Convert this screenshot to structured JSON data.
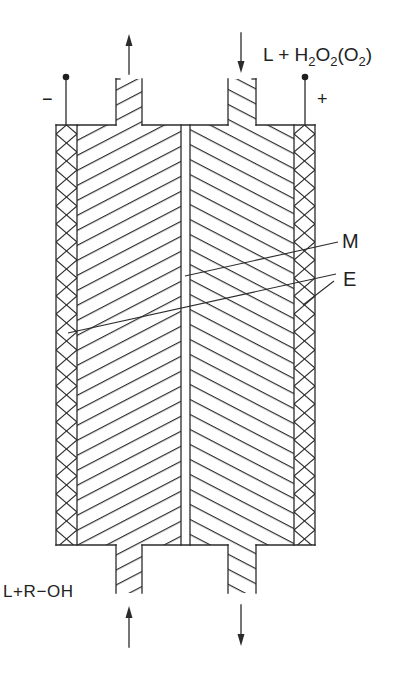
{
  "diagram": {
    "labels": {
      "top_right": {
        "parts": [
          "L + H",
          "2",
          "O",
          "2",
          "(O",
          "2",
          ")"
        ]
      },
      "bottom_left": "L+R−OH",
      "membrane": "M",
      "electrode": "E",
      "terminal_negative": "−",
      "terminal_positive": "+"
    },
    "components": [
      {
        "id": "M",
        "name": "membrane",
        "position": "center"
      },
      {
        "id": "E",
        "name": "electrodes",
        "position": "left and right walls"
      }
    ],
    "flows": [
      {
        "position": "top-left",
        "direction": "up",
        "role": "outlet"
      },
      {
        "position": "top-right",
        "direction": "down",
        "role": "inlet",
        "label": "L + H2O2(O2)"
      },
      {
        "position": "bottom-left",
        "direction": "up",
        "role": "inlet",
        "label": "L+R−OH"
      },
      {
        "position": "bottom-right",
        "direction": "down",
        "role": "outlet"
      }
    ],
    "terminals": [
      {
        "side": "left",
        "polarity": "−"
      },
      {
        "side": "right",
        "polarity": "+"
      }
    ],
    "colors": {
      "line": "#2b2b2b",
      "background": "#ffffff"
    }
  }
}
